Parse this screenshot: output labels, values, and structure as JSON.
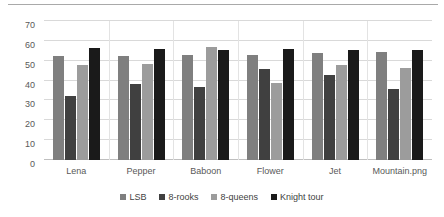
{
  "chart_data": {
    "type": "bar",
    "title": "",
    "subtitle": "",
    "xlabel": "",
    "ylabel": "",
    "ylim": [
      0,
      70
    ],
    "yticks": [
      0,
      10,
      20,
      30,
      40,
      50,
      60,
      70
    ],
    "grid": true,
    "legend_position": "bottom",
    "categories": [
      "Lena",
      "Pepper",
      "Baboon",
      "Flower",
      "Jet",
      "Mountain.png"
    ],
    "series": [
      {
        "name": "LSB",
        "color": "#7f7f7f",
        "values": [
          52.5,
          52.5,
          53,
          53,
          54,
          54.5
        ]
      },
      {
        "name": "8-rooks",
        "color": "#404040",
        "values": [
          32,
          38.5,
          37,
          46,
          43,
          36
        ]
      },
      {
        "name": "8-queens",
        "color": "#9c9c9c",
        "values": [
          48,
          48.5,
          57,
          39,
          48,
          46.5
        ]
      },
      {
        "name": "Knight tour",
        "color": "#1a1a1a",
        "values": [
          56.5,
          56,
          55.5,
          56,
          55.5,
          55.5
        ]
      }
    ]
  },
  "axis": {
    "y_tick_labels": [
      "70",
      "60",
      "50",
      "40",
      "30",
      "20",
      "10",
      "0"
    ]
  },
  "legend": {
    "items": [
      {
        "label": "LSB",
        "color": "#7f7f7f"
      },
      {
        "label": "8-rooks",
        "color": "#404040"
      },
      {
        "label": "8-queens",
        "color": "#9c9c9c"
      },
      {
        "label": "Knight tour",
        "color": "#1a1a1a"
      }
    ]
  },
  "colors": {
    "gridline": "#d9d9d9",
    "axis_text": "#595959",
    "legend_text": "#3f3f3f",
    "background": "#ffffff",
    "top_rule": "#a9a9a9"
  }
}
